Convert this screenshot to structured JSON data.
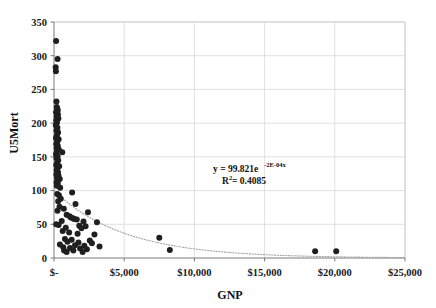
{
  "chart_data": {
    "type": "scatter",
    "title": "",
    "xlabel": "GNP",
    "ylabel": "U5Mort",
    "xlim": [
      0,
      25000
    ],
    "ylim": [
      0,
      350
    ],
    "grid": true,
    "legend": "none",
    "x_tick_labels": [
      "$-",
      "$5,000",
      "$10,000",
      "$15,000",
      "$20,000",
      "$25,000"
    ],
    "x_tick_values": [
      0,
      5000,
      10000,
      15000,
      20000,
      25000
    ],
    "y_tick_labels": [
      "0",
      "50",
      "100",
      "150",
      "200",
      "250",
      "300",
      "350"
    ],
    "y_tick_values": [
      0,
      50,
      100,
      150,
      200,
      250,
      300,
      350
    ],
    "annotations": {
      "equation_prefix": "y = 99.821e",
      "equation_exponent": "-2E-04x",
      "r_squared_prefix": "R",
      "r_squared_sup": "2",
      "r_squared_value": " = 0.4085",
      "equation_full": "y = 99.821e^-2E-04x",
      "r_squared_full": "R² = 0.4085"
    },
    "trendline": {
      "type": "exponential",
      "equation": "y = 99.821 * exp(-0.0002 * x)",
      "coefficient": 99.821,
      "rate": -0.0002,
      "r_squared": 0.4085,
      "style": "dotted",
      "color": "#a6a6a6"
    },
    "marker": {
      "shape": "circle",
      "color": "#1f1f1f",
      "size": 3.0
    },
    "points": [
      [
        150,
        322
      ],
      [
        255,
        295
      ],
      [
        120,
        283
      ],
      [
        135,
        277
      ],
      [
        175,
        232
      ],
      [
        200,
        224
      ],
      [
        230,
        221
      ],
      [
        265,
        219
      ],
      [
        150,
        216
      ],
      [
        280,
        213
      ],
      [
        190,
        210
      ],
      [
        310,
        207
      ],
      [
        160,
        204
      ],
      [
        215,
        201
      ],
      [
        130,
        197
      ],
      [
        245,
        193
      ],
      [
        175,
        189
      ],
      [
        290,
        186
      ],
      [
        205,
        182
      ],
      [
        140,
        178
      ],
      [
        330,
        176
      ],
      [
        230,
        172
      ],
      [
        165,
        169
      ],
      [
        270,
        166
      ],
      [
        190,
        163
      ],
      [
        345,
        161
      ],
      [
        210,
        158
      ],
      [
        590,
        157
      ],
      [
        145,
        154
      ],
      [
        255,
        151
      ],
      [
        180,
        148
      ],
      [
        300,
        145
      ],
      [
        225,
        141
      ],
      [
        160,
        138
      ],
      [
        370,
        136
      ],
      [
        240,
        133
      ],
      [
        195,
        130
      ],
      [
        285,
        127
      ],
      [
        170,
        124
      ],
      [
        320,
        122
      ],
      [
        215,
        119
      ],
      [
        410,
        117
      ],
      [
        250,
        115
      ],
      [
        185,
        112
      ],
      [
        275,
        110
      ],
      [
        200,
        107
      ],
      [
        440,
        104
      ],
      [
        1290,
        97
      ],
      [
        230,
        95
      ],
      [
        350,
        93
      ],
      [
        480,
        88
      ],
      [
        300,
        84
      ],
      [
        1530,
        80
      ],
      [
        390,
        76
      ],
      [
        700,
        73
      ],
      [
        250,
        70
      ],
      [
        2420,
        68
      ],
      [
        900,
        64
      ],
      [
        1110,
        62
      ],
      [
        1200,
        60
      ],
      [
        1350,
        59
      ],
      [
        1440,
        58
      ],
      [
        1620,
        57
      ],
      [
        550,
        55
      ],
      [
        2100,
        54
      ],
      [
        3060,
        53
      ],
      [
        160,
        50
      ],
      [
        330,
        49
      ],
      [
        1800,
        48
      ],
      [
        2250,
        47
      ],
      [
        840,
        45
      ],
      [
        1950,
        44
      ],
      [
        620,
        40
      ],
      [
        1080,
        38
      ],
      [
        1680,
        36
      ],
      [
        2880,
        35
      ],
      [
        7500,
        30
      ],
      [
        780,
        28
      ],
      [
        1260,
        27
      ],
      [
        2550,
        26
      ],
      [
        960,
        24
      ],
      [
        1740,
        23
      ],
      [
        2700,
        22
      ],
      [
        420,
        20
      ],
      [
        1500,
        19
      ],
      [
        2160,
        18
      ],
      [
        3240,
        17
      ],
      [
        660,
        16
      ],
      [
        1140,
        15
      ],
      [
        1860,
        14
      ],
      [
        2340,
        13
      ],
      [
        8250,
        12
      ],
      [
        720,
        11
      ],
      [
        1380,
        11
      ],
      [
        18600,
        10
      ],
      [
        20100,
        10
      ],
      [
        900,
        9
      ],
      [
        2040,
        9
      ]
    ]
  }
}
